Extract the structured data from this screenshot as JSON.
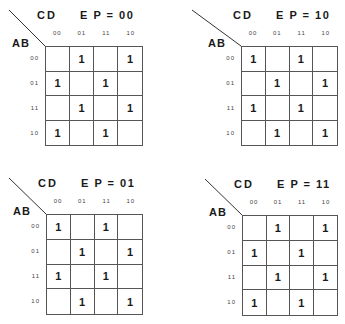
{
  "diagram": {
    "type": "karnaugh-maps",
    "row_variable_label": "AB",
    "column_variable_label": "CD",
    "column_headers": [
      "00",
      "01",
      "11",
      "10"
    ],
    "row_headers": [
      "00",
      "01",
      "11",
      "10"
    ],
    "maps": [
      {
        "title": "E P = 00",
        "cells": [
          [
            "",
            "1",
            "",
            "1"
          ],
          [
            "1",
            "",
            "1",
            ""
          ],
          [
            "",
            "1",
            "",
            "1"
          ],
          [
            "1",
            "",
            "1",
            ""
          ]
        ]
      },
      {
        "title": "E P = 10",
        "cells": [
          [
            "1",
            "",
            "1",
            ""
          ],
          [
            "",
            "1",
            "",
            "1"
          ],
          [
            "1",
            "",
            "1",
            ""
          ],
          [
            "",
            "1",
            "",
            "1"
          ]
        ]
      },
      {
        "title": "E P = 01",
        "cells": [
          [
            "1",
            "",
            "1",
            ""
          ],
          [
            "",
            "1",
            "",
            "1"
          ],
          [
            "1",
            "",
            "1",
            ""
          ],
          [
            "",
            "1",
            "",
            "1"
          ]
        ]
      },
      {
        "title": "E P = 11",
        "cells": [
          [
            "",
            "1",
            "",
            "1"
          ],
          [
            "1",
            "",
            "1",
            ""
          ],
          [
            "",
            "1",
            "",
            "1"
          ],
          [
            "1",
            "",
            "1",
            ""
          ]
        ]
      }
    ]
  }
}
